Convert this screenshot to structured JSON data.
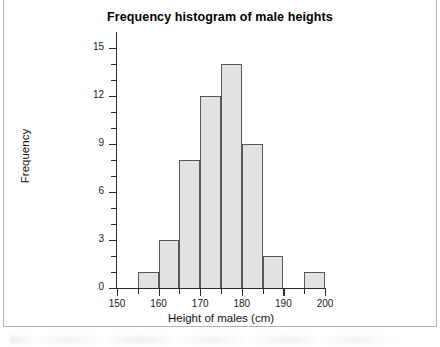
{
  "chart_data": {
    "type": "bar",
    "title": "Frequency histogram of male heights",
    "xlabel": "Height of males (cm)",
    "ylabel": "Frequency",
    "xlim": [
      150,
      200
    ],
    "ylim": [
      0,
      16
    ],
    "grid": false,
    "legend": null,
    "bin_width": 5,
    "bin_edges": [
      150,
      155,
      160,
      165,
      170,
      175,
      180,
      185,
      190,
      195,
      200
    ],
    "categories": [
      "150-155",
      "155-160",
      "160-165",
      "165-170",
      "170-175",
      "175-180",
      "180-185",
      "185-190",
      "190-195",
      "195-200"
    ],
    "values": [
      0,
      1,
      3,
      8,
      12,
      14,
      9,
      2,
      0,
      1
    ],
    "bars": [
      {
        "x0": 155,
        "x1": 160,
        "value": 1
      },
      {
        "x0": 160,
        "x1": 165,
        "value": 3
      },
      {
        "x0": 165,
        "x1": 170,
        "value": 8
      },
      {
        "x0": 170,
        "x1": 175,
        "value": 12
      },
      {
        "x0": 175,
        "x1": 180,
        "value": 14
      },
      {
        "x0": 180,
        "x1": 185,
        "value": 9
      },
      {
        "x0": 185,
        "x1": 190,
        "value": 2
      },
      {
        "x0": 195,
        "x1": 200,
        "value": 1
      }
    ],
    "x_ticks": [
      150,
      160,
      170,
      180,
      190,
      200
    ],
    "x_tick_labels": [
      "150",
      "160",
      "170",
      "180",
      "190",
      "200"
    ],
    "x_minor_ticks": [
      155,
      165,
      175,
      185,
      195
    ],
    "y_ticks": [
      0,
      3,
      6,
      9,
      12,
      15
    ],
    "y_tick_labels": [
      "0",
      "3",
      "6",
      "9",
      "12",
      "15"
    ],
    "y_minor_ticks": [
      1,
      2,
      4,
      5,
      7,
      8,
      10,
      11,
      13,
      14
    ],
    "colors": {
      "bar_fill": "#e2e2e2",
      "bar_edge": "#585858",
      "axis": "#2b2b2b",
      "text": "#111111",
      "background": "#ffffff",
      "frame": "#b3b3b3"
    }
  }
}
